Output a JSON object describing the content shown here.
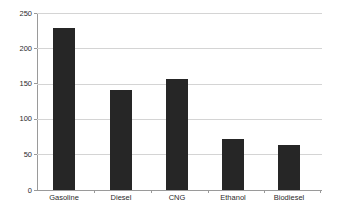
{
  "chart_data": {
    "type": "bar",
    "title": "",
    "xlabel": "",
    "ylabel": "",
    "categories": [
      "Gasoline",
      "Diesel",
      "CNG",
      "Ethanol",
      "Biodiesel"
    ],
    "values": [
      229,
      141,
      157,
      72,
      63
    ],
    "ylim": [
      0,
      250
    ],
    "ytick_labels": [
      "0",
      "50",
      "100",
      "150",
      "200",
      "250"
    ],
    "ytick_values": [
      0,
      50,
      100,
      150,
      200,
      250
    ],
    "grid": true,
    "grid_axis": "y",
    "legend": false,
    "legend_position": "none",
    "bar_color": "#262626",
    "gridline_color": "#d4d4d4",
    "axis_color": "#9a9a9a",
    "tick_label_color": "#2b2b2b",
    "background_color": "#ffffff"
  }
}
